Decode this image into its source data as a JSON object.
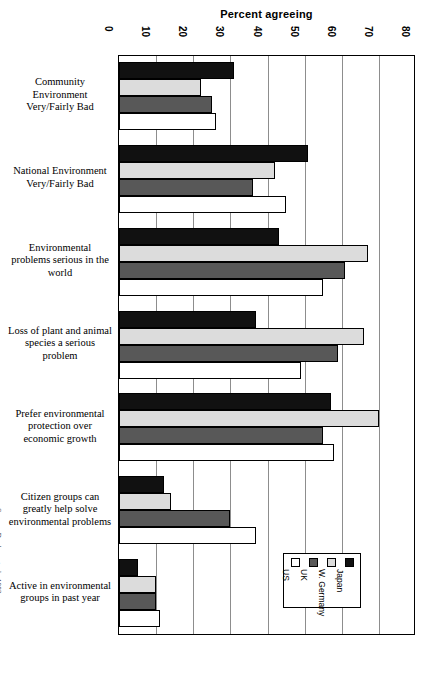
{
  "chart_data": {
    "type": "bar",
    "orientation": "horizontal",
    "title": "Percent agreeing",
    "xlabel": "Percent agreeing",
    "ylabel": "",
    "xlim": [
      0,
      80
    ],
    "xticks": [
      0,
      10,
      20,
      30,
      40,
      50,
      60,
      70,
      80
    ],
    "grid": true,
    "legend_position": "bottom-right",
    "categories": [
      "Community Environment Very/Fairly Bad",
      "National Environment Very/Fairly Bad",
      "Environmental problems serious in the world",
      "Loss of plant and animal species a serious problem",
      "Prefer environmental protection over economic growth",
      "Citizen groups can greatly help solve environmental problems",
      "Active in environmental groups in past year"
    ],
    "series": [
      {
        "name": "Japan",
        "color": "#111111",
        "values": [
          31,
          51,
          43,
          37,
          57,
          12,
          5
        ]
      },
      {
        "name": "W. Germany",
        "color": "#dcdcdc",
        "values": [
          22,
          42,
          67,
          66,
          70,
          14,
          10
        ]
      },
      {
        "name": "UK",
        "color": "#585858",
        "values": [
          25,
          36,
          61,
          59,
          55,
          30,
          10
        ]
      },
      {
        "name": "US",
        "color": "#ffffff",
        "values": [
          26,
          45,
          55,
          49,
          58,
          37,
          11
        ]
      }
    ],
    "source": "Source: Dunlap, et. al., 1992"
  },
  "axis": {
    "tick_labels": [
      "0",
      "10",
      "20",
      "30",
      "40",
      "50",
      "60",
      "70",
      "80"
    ]
  },
  "category_labels": [
    {
      "lines": [
        "Community",
        "Environment",
        "Very/Fairly Bad"
      ]
    },
    {
      "lines": [
        "National Environment",
        "Very/Fairly Bad"
      ]
    },
    {
      "lines": [
        "Environmental",
        "problems serious in the",
        "world"
      ]
    },
    {
      "lines": [
        "Loss of plant and animal",
        "species a serious",
        "problem"
      ]
    },
    {
      "lines": [
        "Prefer environmental",
        "protection over",
        "economic growth"
      ]
    },
    {
      "lines": [
        "Citizen groups can",
        "greatly help solve",
        "environmental problems"
      ]
    },
    {
      "lines": [
        "Active in environmental",
        "groups in past year"
      ]
    }
  ],
  "legend": {
    "items": [
      {
        "label": "Japan",
        "swatch": "japan"
      },
      {
        "label": "W. Germany",
        "swatch": "wgermany"
      },
      {
        "label": "UK",
        "swatch": "uk"
      },
      {
        "label": "US",
        "swatch": "us"
      }
    ]
  },
  "source_note": "Source: Dunlap, et. al., 1992"
}
